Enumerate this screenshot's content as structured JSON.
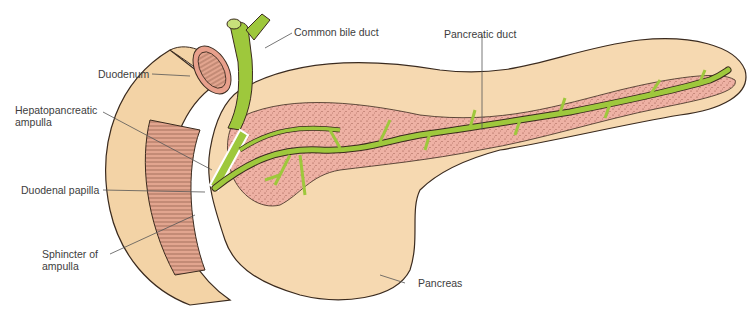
{
  "figure": {
    "type": "anatomical-illustration"
  },
  "labels": {
    "duodenum": "Duodenum",
    "hepatopancreatic_ampulla_line1": "Hepatopancreatic",
    "hepatopancreatic_ampulla_line2": "ampulla",
    "duodenal_papilla": "Duodenal papilla",
    "sphincter_line1": "Sphincter of",
    "sphincter_line2": "ampulla",
    "common_bile_duct": "Common bile duct",
    "pancreatic_duct": "Pancreatic duct",
    "pancreas": "Pancreas"
  },
  "colors": {
    "duodenum_outer": "#f3d3a6",
    "duodenum_muscle": "#e2a58f",
    "pancreas_tissue": "#f6d9b1",
    "pancreas_inner": "#eeb1a4",
    "duct_green": "#9ec83c",
    "outline": "#3a2a1e",
    "label_text": "#3d3d3d"
  }
}
